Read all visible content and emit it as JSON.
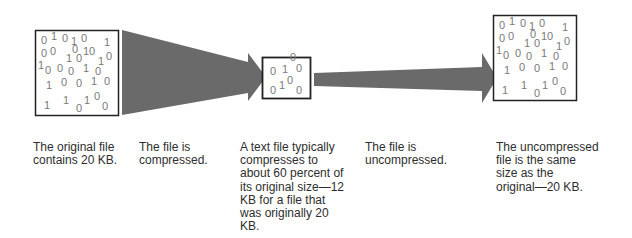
{
  "diagram": {
    "colors": {
      "arrow": "#6a6a6a",
      "box_border": "#222222",
      "digit": "#7a7a7a",
      "text": "#2e2e2e"
    },
    "stages": [
      {
        "id": "original",
        "label": "The original file\ncontains 20 KB.",
        "digits": [
          "0 1 0 1 0 1",
          "0 0 0 10",
          "1 0 1 0",
          "1 0 0 0 1 0",
          "1 0 0 1 0",
          "1 1 0 1 0 0"
        ]
      },
      {
        "id": "compress-arrow",
        "label": "The file is\ncompressed."
      },
      {
        "id": "compressed",
        "label": "A text file typically\ncompresses to\nabout 60 percent of\nits original size—12\nKB for a file that\nwas originally 20\nKB.",
        "digits": [
          "0 1 0",
          "0 1 0 0"
        ]
      },
      {
        "id": "uncompress-arrow",
        "label": "The file is\nuncompressed."
      },
      {
        "id": "uncompressed",
        "label": "The uncompressed\nfile is the same\nsize as the\noriginal—20 KB.",
        "digits": [
          "0 1 0 1 0 1",
          "0 0 0 10",
          "1 0 1 0",
          "1 0 0 0 1 0",
          "1 0 0 1 0",
          "1 1 0 1 0 0"
        ]
      }
    ]
  }
}
